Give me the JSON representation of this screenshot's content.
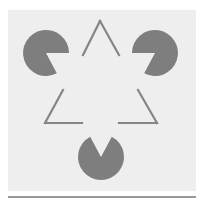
{
  "figure": {
    "colors": {
      "page": "#ffffff",
      "panel": "#eeeeee",
      "shape": "#7e7e7e",
      "outline": "#858585",
      "rule": "#777777"
    },
    "panel": {
      "x": 8,
      "y": 10,
      "w": 188,
      "h": 181
    },
    "rule": {
      "x1": 8,
      "x2": 196,
      "y": 197
    },
    "pacmen": [
      {
        "name": "pacman-top-left",
        "cx": 46,
        "cy": 53,
        "r": 23,
        "mouth_start_deg": 0,
        "mouth_end_deg": 62
      },
      {
        "name": "pacman-top-right",
        "cx": 155,
        "cy": 53,
        "r": 23,
        "mouth_start_deg": 118,
        "mouth_end_deg": 180
      },
      {
        "name": "pacman-bottom",
        "cx": 101,
        "cy": 157,
        "r": 23,
        "mouth_start_deg": 242,
        "mouth_end_deg": 298
      }
    ],
    "outline_triangle": {
      "apex": [
        100,
        21
      ],
      "left": [
        45,
        123
      ],
      "right": [
        157,
        123
      ],
      "gap_segments": [
        {
          "name": "outline-top-left-stroke",
          "x1": 83,
          "y1": 55,
          "x2": 100,
          "y2": 21
        },
        {
          "name": "outline-top-right-stroke",
          "x1": 100,
          "y1": 21,
          "x2": 119,
          "y2": 55
        },
        {
          "name": "outline-left-side-stroke",
          "x1": 63,
          "y1": 90,
          "x2": 45,
          "y2": 123
        },
        {
          "name": "outline-left-base-stroke",
          "x1": 45,
          "y1": 123,
          "x2": 82,
          "y2": 123
        },
        {
          "name": "outline-right-side-stroke",
          "x1": 138,
          "y1": 90,
          "x2": 157,
          "y2": 123
        },
        {
          "name": "outline-right-base-stroke",
          "x1": 119,
          "y1": 123,
          "x2": 157,
          "y2": 123
        }
      ]
    }
  }
}
